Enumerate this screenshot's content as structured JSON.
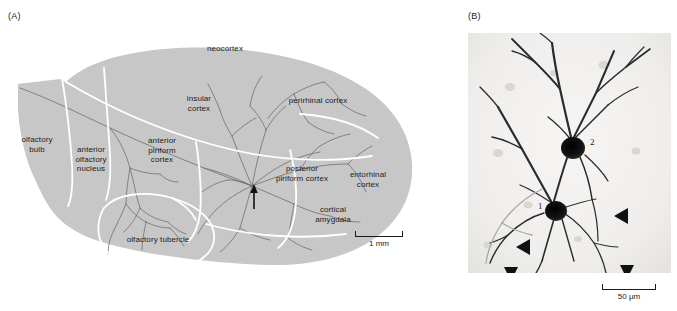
{
  "figure": {
    "panels": [
      {
        "id": "A",
        "label": "(A)",
        "description": "Sagittal diagram of rat brain olfactory areas with labeled axonal projections",
        "regions": [
          {
            "name": "neocortex",
            "label": "neocortex"
          },
          {
            "name": "insular-cortex",
            "label": "insular\ncortex"
          },
          {
            "name": "perirhinal-cortex",
            "label": "perirhinal cortex"
          },
          {
            "name": "olfactory-bulb",
            "label": "olfactory\nbulb"
          },
          {
            "name": "anterior-olfactory-nucleus",
            "label": "anterior\nolfactory\nnucleus"
          },
          {
            "name": "anterior-piriform-cortex",
            "label": "anterior\npiriform\ncortex"
          },
          {
            "name": "posterior-piriform-cortex",
            "label": "posterior\npiriform cortex"
          },
          {
            "name": "entorhinal-cortex",
            "label": "entorhinal\ncortex"
          },
          {
            "name": "cortical-amygdala",
            "label": "cortical\namygdala"
          },
          {
            "name": "olfactory-tubercle",
            "label": "olfactory tubercle"
          }
        ],
        "injection_site_marker": "arrow",
        "scalebar": {
          "length_label": "1 mm"
        },
        "colors": {
          "brain_fill": "#c7c7c7",
          "boundary_line": "#ffffff",
          "axon_trace": "#6e6e6e",
          "label_text": "#1c1c1c"
        }
      },
      {
        "id": "B",
        "label": "(B)",
        "description": "Photomicrograph of two retrogradely labeled pyramidal neurons",
        "cells": [
          {
            "name": "cell-1",
            "label": "1"
          },
          {
            "name": "cell-2",
            "label": "2"
          }
        ],
        "arrowhead_count": 4,
        "scalebar": {
          "length_label": "50 µm"
        },
        "colors": {
          "background": "#f2f1ef",
          "stain": "#1a1a1a",
          "label_text": "#1a1a1a"
        }
      }
    ]
  }
}
